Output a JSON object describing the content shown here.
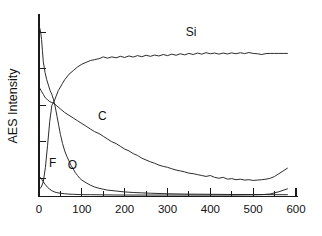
{
  "chart_data": {
    "type": "line",
    "title": "",
    "subtitle": "",
    "xlabel": "",
    "ylabel": "AES Intensity",
    "xlim": [
      0,
      600
    ],
    "ylim": [
      0,
      100
    ],
    "grid": false,
    "legend_position": "inline-annotations",
    "x_tick_labels": [
      "0",
      "100",
      "200",
      "300",
      "400",
      "500",
      "600"
    ],
    "x_tick_values": [
      0,
      100,
      200,
      300,
      400,
      500,
      600
    ],
    "x_minor_tick_values": [
      50,
      150,
      250,
      350,
      450,
      550
    ],
    "y_tick_labels": [],
    "y_tick_values": [
      10,
      30,
      50,
      70,
      90
    ],
    "annotations": [
      {
        "text": "Si",
        "x": 355,
        "y": 88
      },
      {
        "text": "C",
        "x": 148,
        "y": 42
      },
      {
        "text": "O",
        "x": 78,
        "y": 15
      },
      {
        "text": "F",
        "x": 32,
        "y": 16
      }
    ],
    "series": [
      {
        "name": "Si",
        "label": "Si",
        "color": "#222222",
        "x": [
          0,
          5,
          10,
          15,
          20,
          25,
          30,
          35,
          40,
          45,
          50,
          55,
          60,
          70,
          80,
          90,
          100,
          110,
          120,
          130,
          140,
          150,
          160,
          170,
          180,
          190,
          200,
          210,
          220,
          230,
          240,
          250,
          260,
          270,
          280,
          290,
          300,
          310,
          320,
          330,
          340,
          350,
          360,
          370,
          380,
          390,
          400,
          410,
          420,
          430,
          440,
          450,
          460,
          470,
          480,
          490,
          500,
          510,
          520,
          530,
          540,
          550,
          560,
          570,
          580
        ],
        "y": [
          4,
          5,
          8,
          16,
          28,
          41,
          50,
          52,
          55,
          58,
          60,
          62,
          64,
          67,
          69,
          71,
          72.5,
          73.5,
          74.5,
          75,
          75.5,
          76.5,
          75.8,
          76.5,
          76,
          76.8,
          76.2,
          77,
          76.4,
          77.2,
          76.6,
          77.4,
          76.8,
          77.5,
          77,
          77.8,
          77.2,
          78,
          77.4,
          78.2,
          77.6,
          78.4,
          77.8,
          78.6,
          78,
          78.8,
          78.2,
          78.6,
          78,
          78.6,
          78.1,
          78.7,
          78.2,
          78.8,
          78.3,
          78.9,
          78.4,
          78.2,
          77.8,
          78.3,
          78.4,
          78.4,
          78.4,
          78.4,
          78.4
        ]
      },
      {
        "name": "C",
        "label": "C",
        "color": "#222222",
        "x": [
          0,
          5,
          10,
          15,
          20,
          25,
          30,
          35,
          40,
          45,
          50,
          60,
          70,
          80,
          90,
          100,
          110,
          120,
          130,
          140,
          150,
          160,
          170,
          180,
          190,
          200,
          210,
          220,
          230,
          240,
          250,
          260,
          270,
          280,
          290,
          300,
          310,
          320,
          330,
          340,
          350,
          360,
          370,
          380,
          390,
          400,
          410,
          420,
          430,
          440,
          450,
          460,
          470,
          480,
          490,
          500,
          510,
          520,
          530,
          540,
          550,
          560,
          570,
          580
        ],
        "y": [
          60,
          58,
          56,
          54,
          53,
          52,
          51.5,
          51,
          50,
          49,
          48,
          46,
          44.5,
          43,
          41.5,
          40,
          38.5,
          37,
          35.5,
          34.5,
          33,
          31.5,
          30,
          29,
          27.5,
          26,
          25,
          23.5,
          22.5,
          21,
          20,
          19,
          18.2,
          17.2,
          16.5,
          16,
          15.2,
          14.5,
          14,
          13.5,
          12.8,
          12.5,
          12,
          11.5,
          11,
          11.5,
          10.5,
          10,
          10.5,
          9.5,
          9.8,
          9.2,
          9.5,
          9,
          9.2,
          8.8,
          9,
          9.2,
          9.5,
          10,
          11,
          12.5,
          14,
          15.5
        ]
      },
      {
        "name": "O",
        "label": "O",
        "color": "#222222",
        "x": [
          0,
          2,
          4,
          6,
          8,
          10,
          14,
          18,
          22,
          26,
          30,
          34,
          38,
          42,
          46,
          50,
          55,
          60,
          65,
          70,
          75,
          80,
          85,
          90,
          95,
          100,
          110,
          120,
          130,
          140,
          150,
          160,
          180,
          200,
          220,
          240,
          260,
          300,
          350,
          400,
          450,
          500,
          550,
          580
        ],
        "y": [
          93,
          92,
          90,
          86,
          80,
          74,
          68,
          64,
          61,
          58,
          56,
          53,
          49,
          44,
          39,
          34,
          29,
          25,
          22,
          19.5,
          17,
          15,
          13,
          11.5,
          10,
          9,
          7.5,
          6.2,
          5.2,
          4.5,
          4,
          3.5,
          3,
          2.5,
          2.2,
          2,
          1.8,
          1.5,
          1.3,
          1.2,
          1.1,
          1.1,
          1,
          1
        ]
      },
      {
        "name": "F",
        "label": "F",
        "color": "#222222",
        "x": [
          0,
          5,
          10,
          15,
          20,
          25,
          30,
          35,
          40,
          50,
          60,
          70,
          80,
          100,
          120,
          150,
          200,
          250,
          300,
          350,
          400,
          450,
          500,
          520,
          540,
          550,
          560,
          570,
          580
        ],
        "y": [
          11,
          10,
          8,
          6.5,
          5,
          4,
          3.2,
          2.6,
          2.2,
          1.8,
          1.5,
          1.3,
          1.2,
          1,
          1,
          0.9,
          0.8,
          0.8,
          0.8,
          0.8,
          0.8,
          0.8,
          0.9,
          1,
          1.4,
          2,
          2.6,
          3.4,
          4.2
        ]
      }
    ]
  },
  "figure": {
    "y_axis_title": "AES Intensity"
  }
}
